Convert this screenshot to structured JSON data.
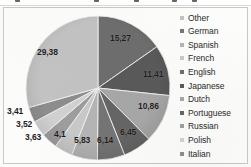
{
  "chart_data": {
    "type": "pie",
    "title": "",
    "subtitle": "",
    "xlabel": "",
    "ylabel": "",
    "grid": false,
    "legend_position": "right",
    "decimal_separator": ",",
    "units": "percent",
    "total": 100,
    "categories": [
      "Other",
      "German",
      "Spanish",
      "French",
      "English",
      "Japanese",
      "Dutch",
      "Portuguese",
      "Russian",
      "Polish",
      "Italian"
    ],
    "values": [
      29.38,
      6.14,
      5.83,
      4.1,
      15.27,
      11.41,
      10.86,
      6.45,
      3.63,
      3.52,
      3.41
    ],
    "labels": [
      "29,38",
      "6,14",
      "5,83",
      "4,1",
      "15,27",
      "11,41",
      "10,86",
      "6,45",
      "3,63",
      "3,52",
      "3,41"
    ],
    "colors": [
      "#c3c3c3",
      "#757575",
      "#b5b5b5",
      "#c9c9c9",
      "#6e6e6e",
      "#5a5a5a",
      "#a8a8a8",
      "#666666",
      "#9e9e9e",
      "#d2d2d2",
      "#8e8e8e"
    ],
    "slice_order_clockwise_from_top": [
      "English",
      "Japanese",
      "Dutch",
      "Portuguese",
      "German",
      "Spanish",
      "French",
      "Russian",
      "Polish",
      "Italian",
      "Other"
    ]
  },
  "slice_labels": {
    "english": "15,27",
    "japanese": "11,41",
    "dutch": "10,86",
    "portuguese": "6,45",
    "german": "6,14",
    "spanish": "5,83",
    "french": "4,1",
    "russian": "3,63",
    "polish": "3,52",
    "italian": "3,41",
    "other": "29,38"
  },
  "legend": {
    "items": [
      {
        "label": "Other",
        "color": "#c3c3c3"
      },
      {
        "label": "German",
        "color": "#757575"
      },
      {
        "label": "Spanish",
        "color": "#b5b5b5"
      },
      {
        "label": "French",
        "color": "#c9c9c9"
      },
      {
        "label": "English",
        "color": "#6e6e6e"
      },
      {
        "label": "Japanese",
        "color": "#5a5a5a"
      },
      {
        "label": "Dutch",
        "color": "#a8a8a8"
      },
      {
        "label": "Portuguese",
        "color": "#666666"
      },
      {
        "label": "Russian",
        "color": "#9e9e9e"
      },
      {
        "label": "Polish",
        "color": "#d2d2d2"
      },
      {
        "label": "Italian",
        "color": "#8e8e8e"
      }
    ]
  }
}
